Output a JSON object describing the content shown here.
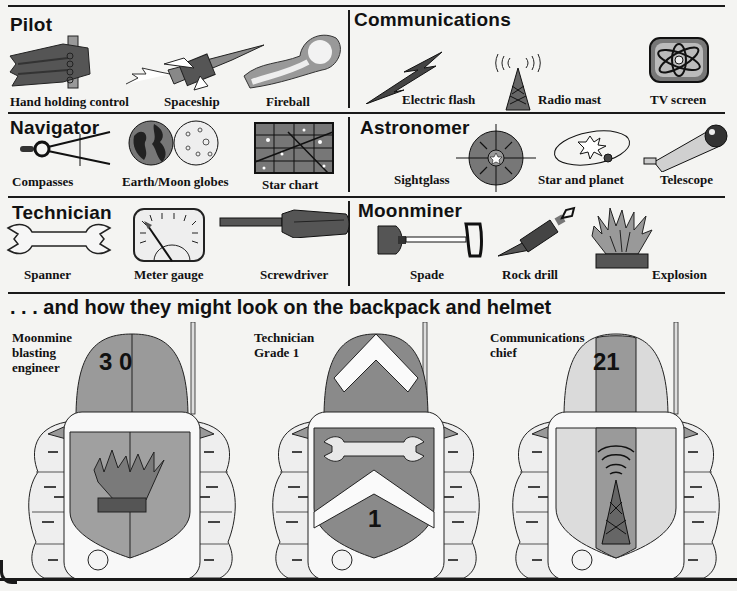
{
  "sections": {
    "pilot": {
      "title": "Pilot",
      "items": [
        {
          "label": "Hand holding control",
          "icon": "hand-control-icon"
        },
        {
          "label": "Spaceship",
          "icon": "spaceship-icon"
        },
        {
          "label": "Fireball",
          "icon": "fireball-icon"
        }
      ]
    },
    "communications": {
      "title": "Communications",
      "items": [
        {
          "label": "Electric flash",
          "icon": "lightning-icon"
        },
        {
          "label": "Radio mast",
          "icon": "radio-mast-icon"
        },
        {
          "label": "TV screen",
          "icon": "tv-screen-icon"
        }
      ]
    },
    "navigator": {
      "title": "Navigator",
      "items": [
        {
          "label": "Compasses",
          "icon": "compasses-icon"
        },
        {
          "label": "Earth/Moon globes",
          "icon": "globes-icon"
        },
        {
          "label": "Star chart",
          "icon": "star-chart-icon"
        }
      ]
    },
    "astronomer": {
      "title": "Astronomer",
      "items": [
        {
          "label": "Sightglass",
          "icon": "sightglass-icon"
        },
        {
          "label": "Star and planet",
          "icon": "star-planet-icon"
        },
        {
          "label": "Telescope",
          "icon": "telescope-icon"
        }
      ]
    },
    "technician": {
      "title": "Technician",
      "items": [
        {
          "label": "Spanner",
          "icon": "spanner-icon"
        },
        {
          "label": "Meter gauge",
          "icon": "meter-gauge-icon"
        },
        {
          "label": "Screwdriver",
          "icon": "screwdriver-icon"
        }
      ]
    },
    "moonminer": {
      "title": "Moonminer",
      "items": [
        {
          "label": "Spade",
          "icon": "spade-icon"
        },
        {
          "label": "Rock drill",
          "icon": "rock-drill-icon"
        },
        {
          "label": "Explosion",
          "icon": "explosion-icon"
        }
      ]
    }
  },
  "banner": ". . . and how they might look on the backpack and helmet",
  "suits": [
    {
      "label_lines": [
        "Moonmine",
        "blasting",
        "engineer"
      ],
      "helmet_number": "3 0",
      "emblem": "explosion"
    },
    {
      "label_lines": [
        "Technician",
        "Grade 1"
      ],
      "helmet_number": "",
      "shield_number": "1",
      "emblem": "spanner-chevron"
    },
    {
      "label_lines": [
        "Communications",
        "chief"
      ],
      "helmet_number": "21",
      "emblem": "radio-mast"
    }
  ],
  "colors": {
    "ink": "#1a1a1a",
    "paper": "#f4f4f2",
    "dark_gray": "#555555",
    "mid_gray": "#8a8a8a",
    "light_gray": "#b8b8b8",
    "pale_gray": "#d8d8d8"
  }
}
